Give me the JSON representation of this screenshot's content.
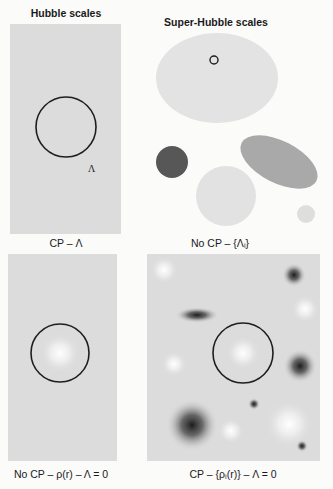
{
  "figure": {
    "headings": {
      "left": "Hubble scales",
      "right": "Super-Hubble scales"
    },
    "panels": [
      {
        "id": "top-left",
        "caption": "CP – Λ",
        "inner_label": "Λ",
        "description": "Uniform grey region with a single Hubble-sized circle"
      },
      {
        "id": "top-right",
        "caption": "No CP – {Λᵢ}",
        "description": "Disconnected regions of differing grey (different Λ values); small circle marks Hubble volume inside large region"
      },
      {
        "id": "bottom-left",
        "caption": "No CP – ρ(r) – Λ = 0",
        "description": "Grey region with a single bright central overdensity inside the Hubble circle"
      },
      {
        "id": "bottom-right",
        "caption": "CP – {ρᵢ(r)} – Λ = 0",
        "description": "Grey region with many bright and dark fluctuations; Hubble circle contains one bright spot"
      }
    ],
    "colors": {
      "panel_grey": "#dcdcdc",
      "region_light": "#e2e2e2",
      "region_mid": "#a9a9a9",
      "region_dark": "#575757",
      "circle_stroke": "#1e1e1e",
      "background": "#fbfbfa"
    }
  }
}
